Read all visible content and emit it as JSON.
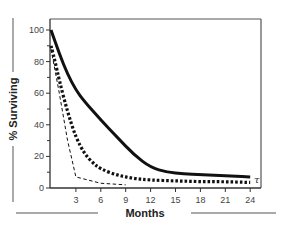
{
  "chart_data": {
    "type": "line",
    "title": "",
    "xlabel": "Months",
    "ylabel": "% Surviving",
    "xlim": [
      0,
      25
    ],
    "ylim": [
      0,
      100
    ],
    "xticks": [
      3,
      6,
      9,
      12,
      15,
      18,
      21,
      24
    ],
    "yticks": [
      0,
      20,
      40,
      60,
      80,
      100
    ],
    "grid": false,
    "legend": null,
    "annotations": [
      {
        "text": "τ",
        "x": 25,
        "y": 3
      }
    ],
    "series": [
      {
        "name": "solid",
        "style": "solid-thick",
        "x": [
          0,
          1,
          2,
          3,
          4,
          6,
          8,
          10,
          12,
          14,
          16,
          18,
          20,
          22,
          24
        ],
        "y": [
          100,
          85,
          72,
          62,
          55,
          43,
          32,
          21,
          13,
          10,
          9,
          8.5,
          8,
          7.5,
          7
        ]
      },
      {
        "name": "dotted",
        "style": "dotted-thick",
        "x": [
          0,
          0.5,
          1,
          2,
          3,
          4,
          5,
          6,
          8,
          10,
          12,
          15,
          18,
          21,
          24
        ],
        "y": [
          90,
          80,
          68,
          48,
          32,
          22,
          16,
          12,
          8,
          6,
          5,
          4.5,
          4,
          4,
          3.5
        ]
      },
      {
        "name": "dashed",
        "style": "dashed-thin",
        "x": [
          0,
          1,
          2,
          3,
          6,
          9
        ],
        "y": [
          88,
          60,
          30,
          7,
          3,
          2
        ]
      }
    ]
  },
  "labels": {
    "x_title": "Months",
    "y_title": "% Surviving",
    "tau": "τ",
    "x_ticks": [
      "3",
      "6",
      "9",
      "12",
      "15",
      "18",
      "21",
      "24"
    ],
    "y_ticks": [
      "0",
      "20",
      "40",
      "60",
      "80",
      "100"
    ]
  }
}
